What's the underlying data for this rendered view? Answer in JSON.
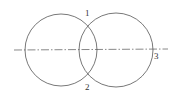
{
  "diagram": {
    "type": "two-intersecting-circles",
    "circles": [
      {
        "name": "left-circle",
        "cx": 61,
        "cy": 50,
        "r": 36
      },
      {
        "name": "right-circle",
        "cx": 116,
        "cy": 50,
        "r": 37
      }
    ],
    "centerline": {
      "x1": 14,
      "y1": 50,
      "x2": 168,
      "y2": 49,
      "style": "dash-dot"
    },
    "labels": [
      {
        "id": "1",
        "text": "1",
        "x": 85,
        "y": 16
      },
      {
        "id": "2",
        "text": "2",
        "x": 85,
        "y": 90
      },
      {
        "id": "3",
        "text": "3",
        "x": 154,
        "y": 59
      }
    ],
    "colors": {
      "stroke": "#555555",
      "label": "#333333",
      "background": "#ffffff"
    }
  }
}
